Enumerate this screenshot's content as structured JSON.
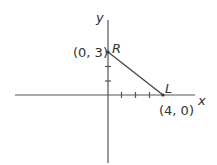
{
  "diagram": {
    "axes": {
      "x_label": "x",
      "y_label": "y",
      "x_ticks": [
        1,
        2,
        3
      ],
      "y_ticks": [
        1,
        2
      ]
    },
    "points": [
      {
        "name": "R",
        "coords_label": "(0, 3)",
        "x": 0,
        "y": 3
      },
      {
        "name": "L",
        "coords_label": "(4, 0)",
        "x": 4,
        "y": 0
      }
    ],
    "segment": {
      "from": "R",
      "to": "L"
    },
    "colors": {
      "line": "#555555",
      "text": "#333333"
    }
  }
}
